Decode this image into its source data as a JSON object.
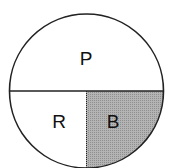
{
  "diagram": {
    "type": "circle-partition",
    "regions": [
      {
        "id": "top",
        "label": "P",
        "fill": "#ffffff"
      },
      {
        "id": "bottom-left",
        "label": "R",
        "fill": "#ffffff"
      },
      {
        "id": "bottom-right",
        "label": "B",
        "fill": "#a9a9a9"
      }
    ],
    "stroke_color": "#222222"
  }
}
